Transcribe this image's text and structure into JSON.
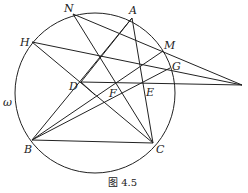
{
  "figure": {
    "caption": "图 4.5",
    "circle_label": "ω",
    "circle": {
      "cx": 95,
      "cy": 93,
      "r": 80
    },
    "points": {
      "A": {
        "label": "A",
        "x": 132,
        "y": 18
      },
      "N": {
        "label": "N",
        "x": 73,
        "y": 14
      },
      "H": {
        "label": "H",
        "x": 32,
        "y": 42
      },
      "M": {
        "label": "M",
        "x": 163,
        "y": 51
      },
      "G": {
        "label": "G",
        "x": 170,
        "y": 68
      },
      "D": {
        "label": "D",
        "x": 81,
        "y": 82
      },
      "F": {
        "label": "F",
        "x": 116,
        "y": 82
      },
      "E": {
        "label": "E",
        "x": 144,
        "y": 84
      },
      "B": {
        "label": "B",
        "x": 32,
        "y": 140
      },
      "C": {
        "label": "C",
        "x": 153,
        "y": 143
      },
      "P": {
        "label": "",
        "x": 242,
        "y": 85
      }
    }
  }
}
